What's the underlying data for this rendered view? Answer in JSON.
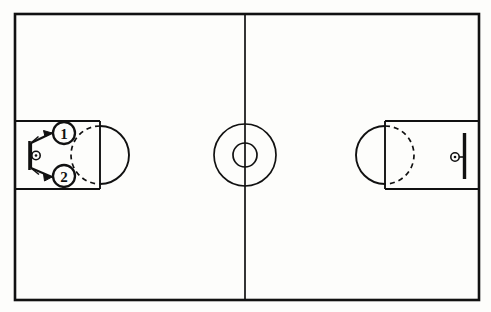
{
  "diagram": {
    "court": {
      "boundary": {
        "x": 15,
        "y": 14,
        "width": 464,
        "height": 286
      },
      "line_color": "#111111",
      "fill_color": "#fdfdfb",
      "halfcourt_line_x": 245,
      "center_circle": {
        "cx": 245,
        "cy": 155,
        "outer_r": 31,
        "inner_r": 12
      }
    },
    "left_key": {
      "lane": {
        "x": 15,
        "y": 121,
        "width": 85,
        "height": 68
      },
      "free_throw_line_x": 100,
      "free_throw_circle": {
        "cx": 100,
        "cy": 155,
        "r": 29
      },
      "solid_arc_side": "right",
      "dashed_arc_side": "left",
      "hoop": {
        "cx": 36,
        "cy": 155,
        "r": 4
      },
      "backboard": {
        "x": 29,
        "y": 141,
        "height": 29
      }
    },
    "right_key": {
      "lane": {
        "x": 385,
        "y": 121,
        "width": 94,
        "height": 68
      },
      "free_throw_line_x": 385,
      "free_throw_circle": {
        "cx": 385,
        "cy": 155,
        "r": 29
      },
      "solid_arc_side": "left",
      "dashed_arc_side": "right",
      "hoop": {
        "cx": 455,
        "cy": 157,
        "r": 4
      },
      "backboard": {
        "x": 464,
        "y": 133,
        "height": 46
      }
    },
    "players": [
      {
        "id": "player-1",
        "label": "1",
        "cx": 64,
        "cy": 133,
        "r": 11
      },
      {
        "id": "player-2",
        "label": "2",
        "cx": 64,
        "cy": 176,
        "r": 11
      }
    ],
    "arrows": [
      {
        "id": "arrow-to-player-1",
        "from_x": 32,
        "from_y": 146,
        "to_x": 51,
        "to_y": 133
      },
      {
        "id": "arrow-to-player-2",
        "from_x": 32,
        "from_y": 165,
        "to_x": 51,
        "to_y": 176
      }
    ]
  }
}
